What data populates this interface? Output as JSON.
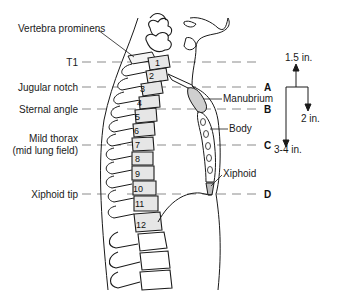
{
  "diagram": {
    "type": "anatomical-lateral-view",
    "left_labels": [
      {
        "id": "vertebra-prominens",
        "text": "Vertebra prominens"
      },
      {
        "id": "t1",
        "text": "T1"
      },
      {
        "id": "jugular-notch",
        "text": "Jugular notch"
      },
      {
        "id": "sternal-angle",
        "text": "Sternal angle"
      },
      {
        "id": "mild-thorax",
        "text": "Mild thorax"
      },
      {
        "id": "mild-thorax-sub",
        "text": "(mid lung field)"
      },
      {
        "id": "xiphoid-tip",
        "text": "Xiphoid tip"
      }
    ],
    "sternum_labels": {
      "manubrium": "Manubrium",
      "body": "Body",
      "xiphoid": "Xiphoid"
    },
    "level_letters": [
      "A",
      "B",
      "C",
      "D"
    ],
    "measurements": {
      "up": "1.5 in.",
      "down_short": "2 in.",
      "down_long": "3-4 in."
    },
    "vertebra_numbers": [
      "1",
      "2",
      "3",
      "4",
      "5",
      "6",
      "7",
      "8",
      "9",
      "10",
      "11",
      "12"
    ],
    "colors": {
      "line": "#1a1a1a",
      "dash": "#8c8c8c",
      "bone_fill": "#e6e6e6",
      "manubrium_fill": "#cfcfcf"
    }
  }
}
